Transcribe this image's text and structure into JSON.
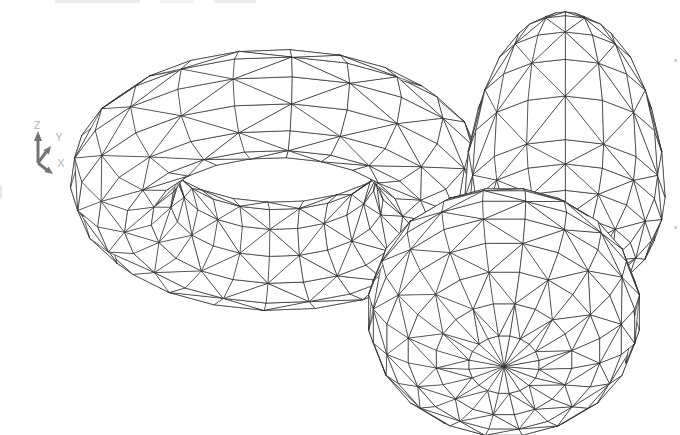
{
  "page": {
    "background": "#ffffff",
    "width": 680,
    "height": 435
  },
  "scene": {
    "description": "hidden-line wireframe render of three meshed solids",
    "stroke_color": "#2b2b2b",
    "fill_color": "#ffffff",
    "stroke_width": 0.7,
    "camera": {
      "elevation_deg": 30,
      "azimuth_deg": 135
    },
    "shapes": [
      {
        "id": "torus",
        "type": "torus",
        "ring_radius": 153,
        "tube_radius": 54,
        "ring_segments": 22,
        "tube_segments": 12,
        "tilt_deg": 0,
        "screen_center": {
          "x": 277,
          "y": 180
        }
      },
      {
        "id": "egg",
        "type": "ellipsoid",
        "equator_radius": 100,
        "top_radius": 215,
        "bottom_radius": 105,
        "meridians": 16,
        "stacks": 12,
        "tilt_deg": 5,
        "screen_center": {
          "x": 565,
          "y": 197
        }
      },
      {
        "id": "sphere",
        "type": "ellipsoid",
        "equator_radius": 137,
        "top_radius": 95,
        "bottom_radius": 95,
        "meridians": 20,
        "stacks": 12,
        "tilt_deg": 25,
        "screen_center": {
          "x": 504,
          "y": 312
        }
      }
    ],
    "draw_order": [
      "torus",
      "egg",
      "sphere"
    ]
  },
  "ucs_icon": {
    "labels": {
      "z": "Z",
      "y": "Y",
      "x": "X"
    },
    "arrow_color": "#757575",
    "label_color": "#b3b3b3"
  },
  "artifacts": [
    {
      "x": 55,
      "y": 0,
      "w": 85,
      "h": 3,
      "color": "#ececec"
    },
    {
      "x": 160,
      "y": 0,
      "w": 34,
      "h": 3,
      "color": "#f2f2f2"
    },
    {
      "x": 214,
      "y": 0,
      "w": 42,
      "h": 3,
      "color": "#ececec"
    },
    {
      "x": 0,
      "y": 185,
      "w": 2,
      "h": 14,
      "color": "#e5e5e5"
    },
    {
      "x": 674,
      "y": 59,
      "w": 3,
      "h": 3,
      "color": "#cfcfcf"
    },
    {
      "x": 674,
      "y": 226,
      "w": 3,
      "h": 3,
      "color": "#cfcfcf"
    }
  ]
}
